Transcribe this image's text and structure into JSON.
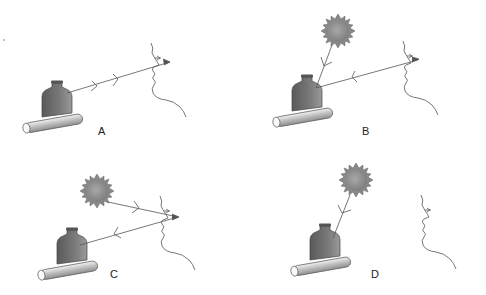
{
  "figure": {
    "panels": [
      {
        "id": "A",
        "label": "A",
        "has_light_source": false,
        "rays": [
          "bottle-to-eye"
        ]
      },
      {
        "id": "B",
        "label": "B",
        "has_light_source": true,
        "rays": [
          "sun-to-bottle",
          "eye-to-bottle"
        ]
      },
      {
        "id": "C",
        "label": "C",
        "has_light_source": true,
        "rays": [
          "sun-to-eye",
          "eye-to-bottle"
        ]
      },
      {
        "id": "D",
        "label": "D",
        "has_light_source": true,
        "rays": [
          "sun-to-bottle"
        ]
      }
    ],
    "colors": {
      "bottle": "#6e6e6e",
      "sun": "#8c8c8c",
      "tube": "#d0d0d0",
      "line": "#555555"
    }
  }
}
